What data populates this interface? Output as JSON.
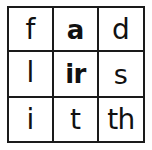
{
  "page": {
    "background_color": "#fefefe",
    "border_color": "#1a1a1a",
    "text_color": "#111111"
  },
  "grid": {
    "rows": 3,
    "columns": 3,
    "cells": [
      {
        "id": "r1c1",
        "text": "f",
        "weight": "regular",
        "row": 1,
        "column": 1
      },
      {
        "id": "r1c2",
        "text": "a",
        "weight": "bold",
        "row": 1,
        "column": 2
      },
      {
        "id": "r1c3",
        "text": "d",
        "weight": "regular",
        "row": 1,
        "column": 3
      },
      {
        "id": "r2c1",
        "text": "l",
        "weight": "regular",
        "row": 2,
        "column": 1
      },
      {
        "id": "r2c2",
        "text": "ir",
        "weight": "bold",
        "row": 2,
        "column": 2
      },
      {
        "id": "r2c3",
        "text": "s",
        "weight": "regular",
        "row": 2,
        "column": 3
      },
      {
        "id": "r3c1",
        "text": "i",
        "weight": "regular",
        "row": 3,
        "column": 1
      },
      {
        "id": "r3c2",
        "text": "t",
        "weight": "regular",
        "row": 3,
        "column": 2
      },
      {
        "id": "r3c3",
        "text": "th",
        "weight": "regular",
        "row": 3,
        "column": 3
      }
    ]
  }
}
